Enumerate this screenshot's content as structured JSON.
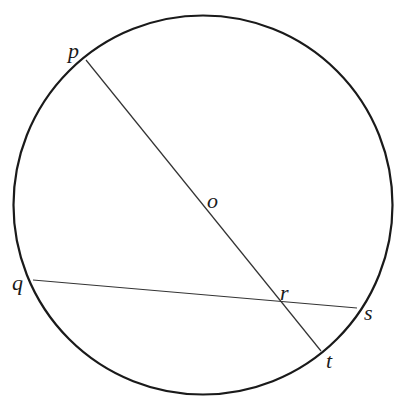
{
  "diagram": {
    "type": "circle-with-chords",
    "colors": {
      "background": "#ffffff",
      "stroke": "#1a1a1a",
      "chord": "#333333"
    },
    "circle": {
      "cx": 203,
      "cy": 205,
      "r": 189.5
    },
    "points": {
      "p": {
        "label": "p",
        "x": 86,
        "y": 60,
        "label_x": 68,
        "label_y": 58
      },
      "o": {
        "label": "o",
        "x": 203,
        "y": 205,
        "label_x": 207,
        "label_y": 208
      },
      "q": {
        "label": "q",
        "x": 33,
        "y": 280,
        "label_x": 12,
        "label_y": 290
      },
      "r": {
        "label": "r",
        "x": 281,
        "y": 301,
        "label_x": 280,
        "label_y": 300
      },
      "s": {
        "label": "s",
        "x": 357,
        "y": 308,
        "label_x": 364,
        "label_y": 320
      },
      "t": {
        "label": "t",
        "x": 321,
        "y": 351,
        "label_x": 326,
        "label_y": 368
      }
    },
    "segments": [
      {
        "name": "pt",
        "from": "p",
        "to": "t",
        "label": "diameter through o"
      },
      {
        "name": "qs",
        "from": "q",
        "to": "s",
        "label": "chord qs"
      }
    ]
  }
}
